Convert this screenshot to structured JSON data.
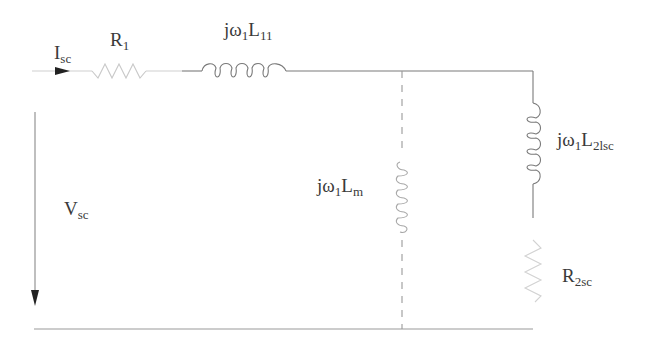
{
  "diagram": {
    "type": "equivalent-circuit",
    "colors": {
      "wire": "#7a7a7a",
      "text": "#3a3a3a",
      "faint": "#c8c8c8"
    },
    "labels": {
      "current": {
        "main": "I",
        "sub": "sc"
      },
      "r1": {
        "main": "R",
        "sub": "1"
      },
      "l11": {
        "main": "jω",
        "sub1": "1",
        "main2": "L",
        "sub2": "11"
      },
      "lm": {
        "main": "jω",
        "sub1": "1",
        "main2": "L",
        "sub2": "m"
      },
      "l2lsc": {
        "main": "jω",
        "sub1": "1",
        "main2": "L",
        "sub2": "2lsc"
      },
      "r2sc": {
        "main": "R",
        "sub": "2sc"
      },
      "voltage": {
        "main": "V",
        "sub": "sc"
      }
    },
    "components": [
      "current-arrow-Isc",
      "resistor-R1",
      "inductor-L11",
      "magnetizing-inductor-Lm (dashed)",
      "inductor-L2lsc",
      "resistor-R2sc",
      "voltage-arrow-Vsc"
    ]
  }
}
